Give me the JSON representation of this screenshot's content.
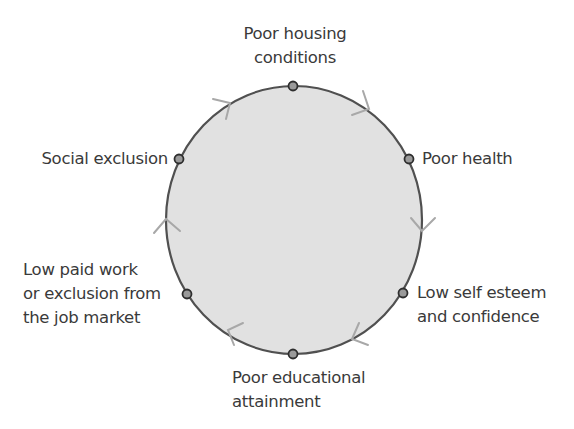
{
  "diagram": {
    "type": "cycle",
    "direction": "clockwise",
    "colors": {
      "circle_fill": "#e1e1e1",
      "circle_stroke": "#505050",
      "node_fill": "#9a9a9a",
      "node_stroke": "#2e2e2e",
      "arrow": "#a8a8a8",
      "text": "#3a3a3a"
    },
    "nodes": [
      {
        "id": "poor-housing",
        "lines": [
          "Poor housing",
          "conditions"
        ]
      },
      {
        "id": "poor-health",
        "lines": [
          "Poor health"
        ]
      },
      {
        "id": "low-self-esteem",
        "lines": [
          "Low self esteem",
          "and confidence"
        ]
      },
      {
        "id": "poor-education",
        "lines": [
          "Poor educational",
          "attainment"
        ]
      },
      {
        "id": "low-paid-work",
        "lines": [
          "Low paid work",
          "or exclusion from",
          "the job market"
        ]
      },
      {
        "id": "social-exclusion",
        "lines": [
          "Social exclusion"
        ]
      }
    ]
  }
}
